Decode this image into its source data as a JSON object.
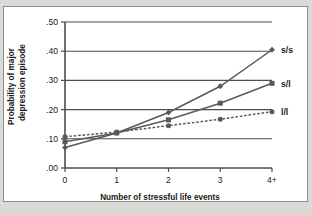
{
  "chart_data": {
    "type": "line",
    "title": "",
    "xlabel": "Number of stressful life events",
    "ylabel": "Probability of major depression episode",
    "ylabel_line1": "Probability of major",
    "ylabel_line2": "depression episode",
    "categories": [
      "0",
      "1",
      "2",
      "3",
      "4+"
    ],
    "x": [
      0,
      1,
      2,
      3,
      4
    ],
    "xlim": [
      0,
      4
    ],
    "ylim": [
      0.0,
      0.5
    ],
    "yticks": [
      0.0,
      0.1,
      0.2,
      0.3,
      0.4,
      0.5
    ],
    "ytick_labels": [
      ".00",
      ".10",
      ".20",
      ".30",
      ".40",
      ".50"
    ],
    "xtick_labels": [
      "0",
      "1",
      "2",
      "3",
      "4+"
    ],
    "grid": true,
    "grid_axis": "y",
    "legend_position": "right-of-line-ends",
    "series": [
      {
        "name": "s/s",
        "values": [
          0.07,
          0.12,
          0.19,
          0.28,
          0.405
        ],
        "color": "#595959",
        "linestyle": "solid",
        "marker": "diamond",
        "label_y": 0.405
      },
      {
        "name": "s/l",
        "values": [
          0.09,
          0.12,
          0.165,
          0.222,
          0.29
        ],
        "color": "#595959",
        "linestyle": "solid",
        "marker": "square",
        "label_y": 0.29
      },
      {
        "name": "l/l",
        "values": [
          0.107,
          0.123,
          0.145,
          0.167,
          0.193
        ],
        "color": "#595959",
        "linestyle": "dashed",
        "marker": "circle",
        "label_y": 0.193
      }
    ]
  },
  "colors": {
    "background": "#d9d9d5",
    "panel": "#ffffff",
    "frame": "#8d8d8a",
    "axis": "#4d4d4d",
    "grid": "#4d4d4d",
    "text": "#1a1a1a",
    "line": "#595959"
  }
}
